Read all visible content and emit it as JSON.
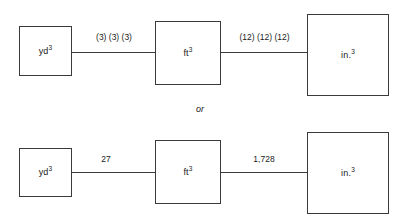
{
  "diagram": {
    "colors": {
      "stroke": "#3a3a3a",
      "text": "#1a1a1a",
      "background": "#ffffff"
    },
    "divider_label": "or",
    "rows": [
      {
        "id": "factored",
        "nodes": [
          {
            "id": "yd3",
            "base": "yd",
            "exponent": "3"
          },
          {
            "id": "ft3",
            "base": "ft",
            "exponent": "3"
          },
          {
            "id": "in3",
            "base": "in.",
            "exponent": "3"
          }
        ],
        "edges": [
          {
            "id": "yd-to-ft",
            "label": "(3) (3) (3)"
          },
          {
            "id": "ft-to-in",
            "label": "(12) (12) (12)"
          }
        ]
      },
      {
        "id": "multiplied",
        "nodes": [
          {
            "id": "yd3",
            "base": "yd",
            "exponent": "3"
          },
          {
            "id": "ft3",
            "base": "ft",
            "exponent": "3"
          },
          {
            "id": "in3",
            "base": "in.",
            "exponent": "3"
          }
        ],
        "edges": [
          {
            "id": "yd-to-ft",
            "label": "27"
          },
          {
            "id": "ft-to-in",
            "label": "1,728"
          }
        ]
      }
    ]
  }
}
